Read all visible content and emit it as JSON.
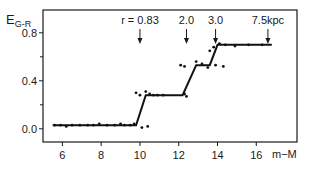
{
  "chart_data": {
    "type": "scatter",
    "title": "",
    "ylabel_main": "E",
    "ylabel_sub": "G-R",
    "xlabel": "m−M",
    "xlim": [
      5.0,
      18.1
    ],
    "ylim": [
      -0.11,
      0.99
    ],
    "xticks": [
      6,
      8,
      10,
      12,
      14,
      16
    ],
    "xtick_labels": [
      "6",
      "8",
      "10",
      "12",
      "14",
      "16"
    ],
    "yticks_major": [
      0.0,
      0.4,
      0.8
    ],
    "ytick_labels": [
      "0.0",
      "0.4",
      "0.8"
    ],
    "yticks_minor": [
      0.2,
      0.6
    ],
    "grid": false,
    "legend": "none",
    "annotations": [
      {
        "text": "r = 0.83",
        "x": 10.0
      },
      {
        "text": "2.0",
        "x": 12.4
      },
      {
        "text": "3.0",
        "x": 13.9
      },
      {
        "text": "7.5kpc",
        "x": 16.6
      }
    ],
    "step_fit": {
      "x": [
        5.5,
        9.8,
        10.3,
        12.2,
        12.9,
        13.6,
        14.0,
        16.8
      ],
      "y": [
        0.03,
        0.03,
        0.28,
        0.28,
        0.53,
        0.53,
        0.7,
        0.7
      ]
    },
    "points": [
      {
        "x": 5.6,
        "y": 0.03
      },
      {
        "x": 5.9,
        "y": 0.03
      },
      {
        "x": 6.2,
        "y": 0.02
      },
      {
        "x": 6.5,
        "y": 0.03
      },
      {
        "x": 6.9,
        "y": 0.03
      },
      {
        "x": 7.3,
        "y": 0.03
      },
      {
        "x": 7.6,
        "y": 0.03
      },
      {
        "x": 7.9,
        "y": 0.04
      },
      {
        "x": 8.3,
        "y": 0.03
      },
      {
        "x": 8.7,
        "y": 0.03
      },
      {
        "x": 9.0,
        "y": 0.04
      },
      {
        "x": 9.2,
        "y": 0.03
      },
      {
        "x": 9.5,
        "y": 0.03
      },
      {
        "x": 9.7,
        "y": 0.04
      },
      {
        "x": 9.8,
        "y": 0.3
      },
      {
        "x": 10.0,
        "y": 0.28
      },
      {
        "x": 10.3,
        "y": 0.31
      },
      {
        "x": 10.5,
        "y": 0.29
      },
      {
        "x": 10.7,
        "y": 0.28
      },
      {
        "x": 10.1,
        "y": 0.01
      },
      {
        "x": 10.4,
        "y": 0.02
      },
      {
        "x": 10.9,
        "y": 0.28
      },
      {
        "x": 11.2,
        "y": 0.28
      },
      {
        "x": 12.3,
        "y": 0.29
      },
      {
        "x": 12.4,
        "y": 0.27
      },
      {
        "x": 12.1,
        "y": 0.53
      },
      {
        "x": 12.3,
        "y": 0.52
      },
      {
        "x": 12.9,
        "y": 0.56
      },
      {
        "x": 13.2,
        "y": 0.54
      },
      {
        "x": 13.5,
        "y": 0.51
      },
      {
        "x": 13.9,
        "y": 0.53
      },
      {
        "x": 14.3,
        "y": 0.52
      },
      {
        "x": 13.6,
        "y": 0.65
      },
      {
        "x": 13.8,
        "y": 0.68
      },
      {
        "x": 14.1,
        "y": 0.71
      },
      {
        "x": 14.4,
        "y": 0.7
      },
      {
        "x": 14.9,
        "y": 0.69
      },
      {
        "x": 15.6,
        "y": 0.7
      },
      {
        "x": 16.3,
        "y": 0.7
      }
    ]
  }
}
